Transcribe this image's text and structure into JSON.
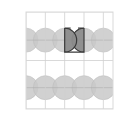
{
  "figure": {
    "title": "",
    "background_color": "#ffffff",
    "plot_area": {
      "x": 26,
      "y": 12,
      "width": 87,
      "height": 97
    },
    "border": {
      "color": "#d9d9d9",
      "width": 1
    }
  },
  "chart_data": {
    "type": "scatter",
    "title": "",
    "xlabel": "",
    "ylabel": "",
    "xlim": [
      0,
      4.5
    ],
    "ylim": [
      0,
      5
    ],
    "grid": true,
    "legend_position": "none",
    "grid_lines": {
      "color": "#cfcfcf",
      "vertical_x": [
        0,
        1,
        2,
        3,
        4
      ],
      "horizontal_y": [
        0,
        2.5,
        5
      ]
    },
    "circles": {
      "radius": 0.62,
      "fill_color": "#c9c9c9",
      "fill_opacity": 0.85,
      "stroke_color": "#bdbdbd",
      "centers": [
        {
          "x": 0.0,
          "y": 3.55
        },
        {
          "x": 1.0,
          "y": 3.55
        },
        {
          "x": 2.0,
          "y": 3.55
        },
        {
          "x": 3.0,
          "y": 3.55
        },
        {
          "x": 4.0,
          "y": 3.55
        },
        {
          "x": 0.0,
          "y": 1.1
        },
        {
          "x": 1.0,
          "y": 1.1
        },
        {
          "x": 2.0,
          "y": 1.1
        },
        {
          "x": 3.0,
          "y": 1.1
        },
        {
          "x": 4.0,
          "y": 1.1
        }
      ]
    },
    "axes_marks": {
      "color": "#a8a8a8",
      "horizontal_y": [
        3.55,
        1.1
      ],
      "tick_color": "#9a9a9a"
    },
    "highlight_region": {
      "name": "butterfly-region",
      "fill_color": "#8c8c8c",
      "fill_opacity": 0.95,
      "stroke_color": "#3a3a3a",
      "stroke_width": 1.2,
      "x_range": [
        2.0,
        3.0
      ],
      "y_top": 4.17,
      "y_base": 3.55,
      "description": "two circular arc lobes forming an M / butterfly shape between the two middle upper circles"
    }
  }
}
